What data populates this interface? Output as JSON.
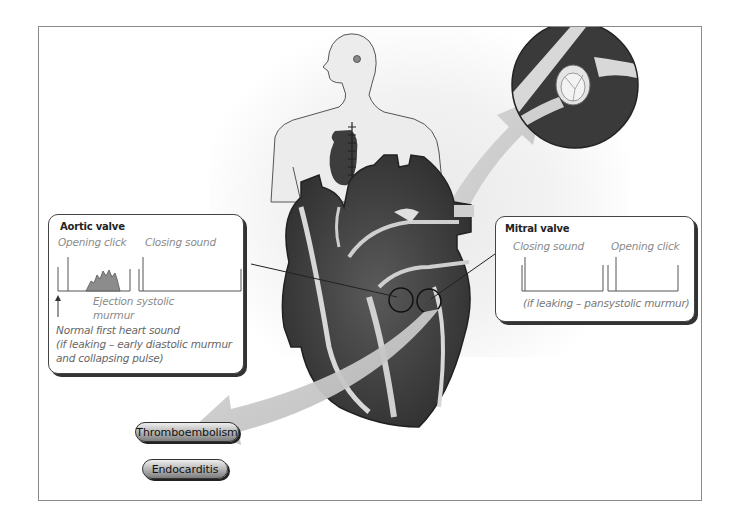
{
  "figure": {
    "aortic_valve": {
      "title": "Aortic valve",
      "labels": {
        "opening_click": "Opening click",
        "closing_sound": "Closing sound",
        "ejection_murmur_line1": "Ejection systolic",
        "ejection_murmur_line2": "murmur",
        "normal_first_line1": "Normal first heart sound",
        "normal_first_line2": "(if leaking – early diastolic murmur",
        "normal_first_line3": "and collapsing pulse)"
      }
    },
    "mitral_valve": {
      "title": "Mitral valve",
      "labels": {
        "closing_sound": "Closing sound",
        "opening_click": "Opening click",
        "leak_note": "(if leaking – pansystolic murmur)"
      }
    },
    "complications": [
      {
        "label": "Thromboembolism"
      },
      {
        "label": "Endocarditis"
      }
    ],
    "illustrations": {
      "body": "human-torso-with-sternotomy-scar",
      "heart": "heart-cross-section",
      "valve_closeup": "prosthetic-valve-closeup"
    },
    "colors": {
      "heart_dark": "#3d3d3d",
      "arrow_gray": "#c8c8c8",
      "border": "#444444"
    }
  }
}
